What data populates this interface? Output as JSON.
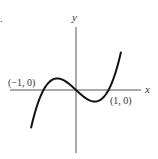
{
  "marker": ".",
  "chart_data": {
    "type": "line",
    "title": "",
    "xlabel": "x",
    "ylabel": "y",
    "function": "cubic with roots at x=-1, 0, 1 (shape of x^3 - x)",
    "annotations": [
      {
        "text": "(−1, 0)",
        "x": -1,
        "y": 0
      },
      {
        "text": "(1, 0)",
        "x": 1,
        "y": 0
      }
    ],
    "series": [
      {
        "name": "f(x)",
        "x": [
          -1.4,
          -1.2,
          -1.0,
          -0.8,
          -0.577,
          -0.4,
          -0.2,
          0,
          0.2,
          0.4,
          0.577,
          0.8,
          1.0,
          1.2,
          1.4
        ],
        "values": [
          -1.34,
          -0.53,
          0,
          0.29,
          0.38,
          0.34,
          0.19,
          0,
          -0.19,
          -0.34,
          -0.38,
          -0.29,
          0,
          0.53,
          1.34
        ]
      }
    ],
    "grid": false,
    "ticks": false
  },
  "labels": {
    "x_axis": "x",
    "y_axis": "y",
    "left_root": "(−1, 0)",
    "right_root": "(1, 0)"
  }
}
